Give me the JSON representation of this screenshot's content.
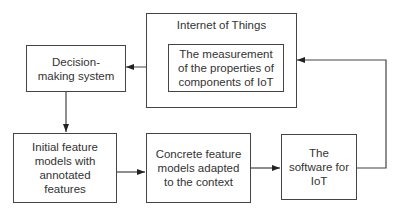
{
  "diagram": {
    "iot_container": {
      "label": "Internet of Things"
    },
    "nodes": {
      "measurement": {
        "label": "The measurement of the properties of components of IoT"
      },
      "decision": {
        "label": "Decision-making system"
      },
      "initial": {
        "label": "Initial feature models with annotated features"
      },
      "concrete": {
        "label": "Concrete feature models adapted to the context"
      },
      "software": {
        "label": "The software for IoT"
      }
    },
    "edges": [
      {
        "from": "measurement",
        "to": "decision"
      },
      {
        "from": "decision",
        "to": "initial"
      },
      {
        "from": "initial",
        "to": "concrete"
      },
      {
        "from": "concrete",
        "to": "software"
      },
      {
        "from": "software",
        "to": "iot_container"
      }
    ],
    "colors": {
      "stroke": "#444444",
      "text": "#333333",
      "background": "#ffffff"
    }
  }
}
